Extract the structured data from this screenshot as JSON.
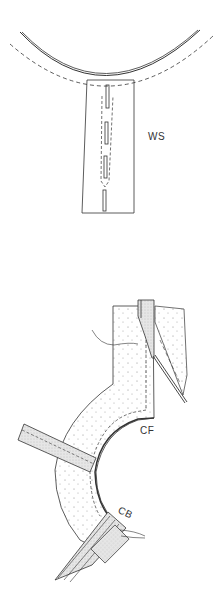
{
  "diagram": {
    "top_figure": {
      "label": "WS",
      "label_pos": {
        "x": 148,
        "y": 131
      }
    },
    "bottom_figure": {
      "label_cf": "CF",
      "label_cf_pos": {
        "x": 140,
        "y": 425
      },
      "label_cb": "CB",
      "label_cb_pos": {
        "x": 118,
        "y": 507
      }
    },
    "colors": {
      "line": "#333333",
      "fill_stipple": "#f4f4f4",
      "tape_fill": "#e0e0e0"
    }
  }
}
